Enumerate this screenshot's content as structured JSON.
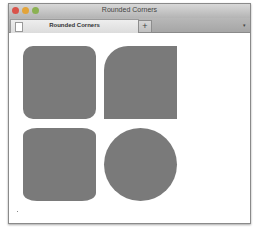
{
  "window": {
    "title": "Rounded Corners",
    "traffic_lights": [
      {
        "name": "close",
        "color": "#d9534a"
      },
      {
        "name": "minimize",
        "color": "#e3a43a"
      },
      {
        "name": "zoom",
        "color": "#8bb152"
      }
    ]
  },
  "tabs": [
    {
      "label": "Rounded Corners",
      "icon": "document-icon",
      "active": true
    }
  ],
  "tabbar": {
    "new_tab_label": "+",
    "menu_icon": "▾"
  },
  "content": {
    "shapes": [
      {
        "name": "rounded-square",
        "color": "#7a7a7a",
        "border_radius": "10px"
      },
      {
        "name": "top-left-rounded-square",
        "color": "#7a7a7a",
        "border_radius": "24px 0 0 0"
      },
      {
        "name": "elliptical-corner-square",
        "color": "#7a7a7a",
        "border_radius": "14px / 8px"
      },
      {
        "name": "circle",
        "color": "#7a7a7a",
        "border_radius": "50%"
      }
    ]
  }
}
